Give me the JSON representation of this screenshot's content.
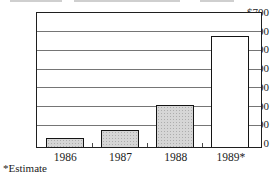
{
  "chart_data": {
    "type": "bar",
    "title": "",
    "categories": [
      "1986",
      "1987",
      "1988",
      "1989*"
    ],
    "values": [
      50,
      90,
      225,
      595
    ],
    "xlabel": "",
    "ylabel": "",
    "ylim": [
      0,
      700
    ],
    "ytick_step": 100,
    "ytick_labels_top_to_bottom": [
      "$700",
      "600",
      "500",
      "400",
      "300",
      "200",
      "100",
      "0"
    ],
    "grid": true,
    "legend": "none",
    "footnote": "*Estimate",
    "styles": {
      "bar_fills": [
        "stipple",
        "stipple",
        "stipple",
        "plain"
      ],
      "stipple_fill_color": "#d6d6d6",
      "plain_fill_color": "#ffffff",
      "bar_border_color": "#141414",
      "frame_color": "#1f1f1f",
      "grid_color": "#757575",
      "text_color": "#1c1c1c",
      "background_color": "#ffffff"
    }
  }
}
